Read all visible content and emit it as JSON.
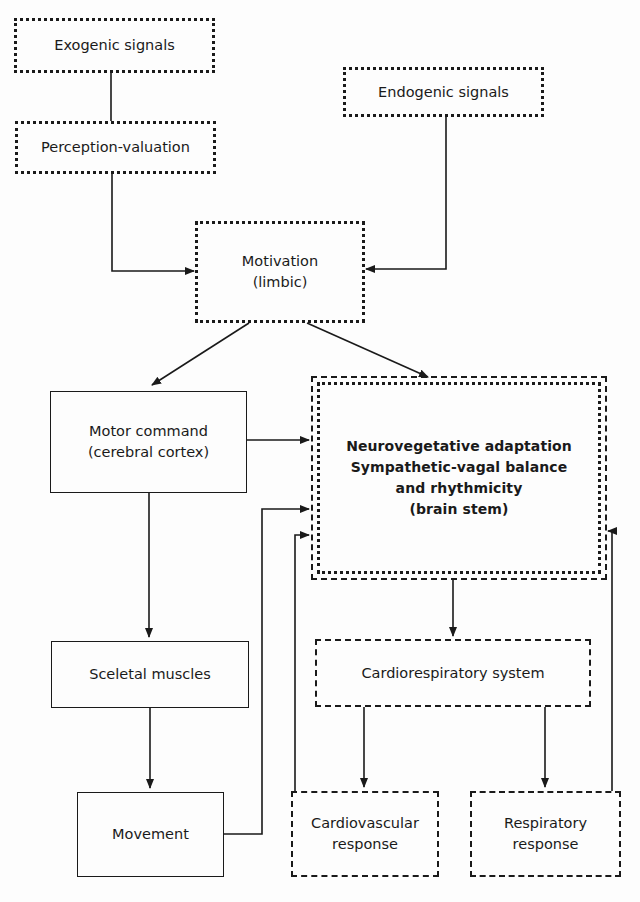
{
  "diagram": {
    "nodes": {
      "exogenic": {
        "lines": [
          "Exogenic signals"
        ],
        "border": "dotted"
      },
      "perception": {
        "lines": [
          "Perception-valuation"
        ],
        "border": "dotted"
      },
      "endogenic": {
        "lines": [
          "Endogenic signals"
        ],
        "border": "dotted"
      },
      "motivation": {
        "lines": [
          "Motivation",
          "(limbic)"
        ],
        "border": "dotted"
      },
      "motor_command": {
        "lines": [
          "Motor command",
          "(cerebral cortex)"
        ],
        "border": "solid"
      },
      "neurovegetative": {
        "lines": [
          "Neurovegetative adaptation",
          "Sympathetic-vagal balance",
          "and rhythmicity",
          "(brain stem)"
        ],
        "border": "dashed+dotted"
      },
      "sceletal_muscles": {
        "lines": [
          "Sceletal muscles"
        ],
        "border": "solid"
      },
      "movement": {
        "lines": [
          "Movement"
        ],
        "border": "solid"
      },
      "cardiorespiratory": {
        "lines": [
          "Cardiorespiratory system"
        ],
        "border": "dashed"
      },
      "cardiovascular_response": {
        "lines": [
          "Cardiovascular",
          "response"
        ],
        "border": "dashed"
      },
      "respiratory_response": {
        "lines": [
          "Respiratory",
          "response"
        ],
        "border": "dashed"
      }
    },
    "edges": [
      {
        "from": "Exogenic signals",
        "to": "Perception-valuation",
        "arrow": false
      },
      {
        "from": "Perception-valuation",
        "to": "Motivation (limbic)",
        "arrow": true
      },
      {
        "from": "Endogenic signals",
        "to": "Motivation (limbic)",
        "arrow": true
      },
      {
        "from": "Motivation (limbic)",
        "to": "Motor command (cerebral cortex)",
        "arrow": true
      },
      {
        "from": "Motivation (limbic)",
        "to": "Neurovegetative adaptation (brain stem)",
        "arrow": true
      },
      {
        "from": "Motor command (cerebral cortex)",
        "to": "Neurovegetative adaptation (brain stem)",
        "arrow": true
      },
      {
        "from": "Motor command (cerebral cortex)",
        "to": "Sceletal muscles",
        "arrow": true
      },
      {
        "from": "Sceletal muscles",
        "to": "Movement",
        "arrow": true
      },
      {
        "from": "Movement",
        "to": "Neurovegetative adaptation (brain stem)",
        "arrow": true
      },
      {
        "from": "Neurovegetative adaptation (brain stem)",
        "to": "Cardiorespiratory system",
        "arrow": true
      },
      {
        "from": "Cardiorespiratory system",
        "to": "Cardiovascular response",
        "arrow": true
      },
      {
        "from": "Cardiorespiratory system",
        "to": "Respiratory response",
        "arrow": true
      },
      {
        "from": "Cardiovascular response",
        "to": "Neurovegetative adaptation (brain stem)",
        "arrow": true
      },
      {
        "from": "Respiratory response",
        "to": "Neurovegetative adaptation (brain stem)",
        "arrow": true
      }
    ],
    "colors": {
      "ink": "#1a1a1a",
      "background": "#fdfdfd"
    }
  }
}
